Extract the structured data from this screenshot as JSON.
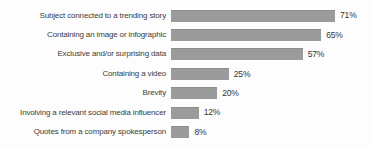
{
  "chart_data": {
    "type": "bar",
    "orientation": "horizontal",
    "title": "",
    "xlabel": "",
    "ylabel": "",
    "categories": [
      "Subject connected to a trending story",
      "Containing an image or infographic",
      "Exclusive and/or surprising data",
      "Containing a video",
      "Brevity",
      "Involving a relevant social media influencer",
      "Quotes from a company spokesperson"
    ],
    "values": [
      71,
      65,
      57,
      25,
      20,
      12,
      8
    ],
    "value_labels": [
      "71%",
      "65%",
      "57%",
      "25%",
      "20%",
      "12%",
      "8%"
    ],
    "value_suffix": "%",
    "xlim": [
      0,
      78
    ],
    "grid": false,
    "legend": false,
    "bar_color": "#9b9b9b",
    "bar_edge_color": "#8d8d8d",
    "label_text_color": "#3c3c3c",
    "value_text_color": "#333333",
    "background_color": "#fdfdfd",
    "px_per_percent": 2.31
  }
}
